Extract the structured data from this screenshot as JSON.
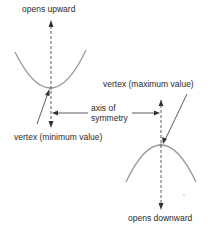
{
  "diagram": {
    "labels": {
      "opens_upward": "opens upward",
      "vertex_min": "vertex (minimum value)",
      "vertex_max": "vertex (maximum value)",
      "axis_line1": "axis of",
      "axis_line2": "symmetry",
      "opens_downward": "opens downward"
    },
    "colors": {
      "curve": "#999999",
      "line": "#333333"
    }
  }
}
